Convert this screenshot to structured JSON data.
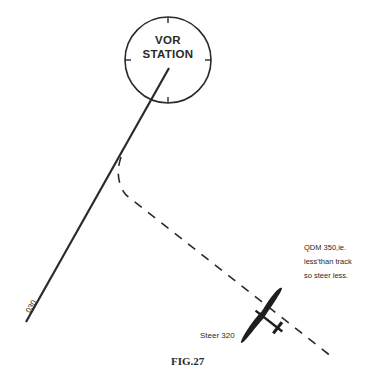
{
  "figure": {
    "caption": "FIG.27",
    "station": {
      "line1": "VOR",
      "line2": "STATION"
    },
    "radial_label": "030",
    "note": {
      "line1": "QDM 350,ie.",
      "line2": "less'than track",
      "line3": "so steer less."
    },
    "steer_label": "Steer 320",
    "colors": {
      "ink": "#2a2a2a",
      "background": "#ffffff"
    }
  }
}
